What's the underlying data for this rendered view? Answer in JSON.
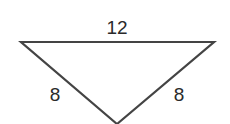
{
  "diagram": {
    "type": "triangle",
    "orientation": "inverted",
    "stroke_color": "#444444",
    "vertices": {
      "top_left": [
        21,
        42
      ],
      "top_right": [
        214,
        42
      ],
      "bottom": [
        117,
        124
      ]
    },
    "labels": {
      "top_side": "12",
      "left_side": "8",
      "right_side": "8"
    }
  }
}
